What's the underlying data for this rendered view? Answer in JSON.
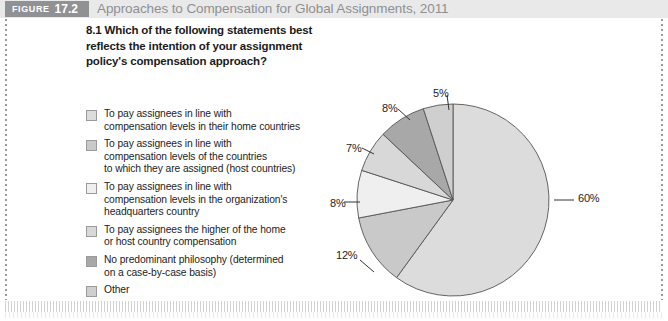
{
  "header": {
    "figure_word": "FIGURE",
    "figure_number": "17.2",
    "title": "Approaches to Compensation for Global Assignments, 2011",
    "band_color": "#e9e9e9",
    "tag_color": "#8f9194",
    "title_color": "#8e9093"
  },
  "question": {
    "text": "8.1 Which of the following statements best reflects the intention of your assignment policy's compensation approach?"
  },
  "legend": {
    "items": [
      {
        "label": "To pay assignees in line with\ncompensation levels in their home countries",
        "color": "#dcdcdc"
      },
      {
        "label": "To pay assignees in line with\ncompensation levels of the countries\nto which they are assigned (host countries)",
        "color": "#c9c9c9"
      },
      {
        "label": "To pay assignees in line with\ncompensation levels in the organization's\nheadquarters country",
        "color": "#efefef"
      },
      {
        "label": "To pay assignees the higher of the home\nor host country compensation",
        "color": "#d8d8d8"
      },
      {
        "label": "No predominant philosophy (determined\non a case-by-case basis)",
        "color": "#a8a8a8"
      },
      {
        "label": "Other",
        "color": "#cfcfcf"
      }
    ]
  },
  "chart_data": {
    "type": "pie",
    "title": "Approaches to Compensation for Global Assignments, 2011",
    "categories": [
      "To pay assignees in line with compensation levels in their home countries",
      "To pay assignees in line with compensation levels of the countries to which they are assigned (host countries)",
      "To pay assignees in line with compensation levels in the organization's headquarters country",
      "To pay assignees the higher of the home or host country compensation",
      "No predominant philosophy (determined on a case-by-case basis)",
      "Other"
    ],
    "values": [
      60,
      12,
      8,
      7,
      8,
      5
    ],
    "labels": [
      "60%",
      "12%",
      "8%",
      "7%",
      "8%",
      "5%"
    ],
    "colors": [
      "#dcdcdc",
      "#c9c9c9",
      "#efefef",
      "#d8d8d8",
      "#a8a8a8",
      "#cfcfcf"
    ],
    "slice_border": "#555555",
    "legend_position": "left",
    "grid": false,
    "start_angle_deg": -90,
    "direction": "clockwise"
  },
  "pie_labels": [
    {
      "text": "60%",
      "x": 256,
      "y": 110
    },
    {
      "text": "12%",
      "x": 14,
      "y": 167
    },
    {
      "text": "8%",
      "x": 8,
      "y": 115
    },
    {
      "text": "7%",
      "x": 24,
      "y": 60
    },
    {
      "text": "8%",
      "x": 60,
      "y": 20
    },
    {
      "text": "5%",
      "x": 111,
      "y": 5
    }
  ]
}
